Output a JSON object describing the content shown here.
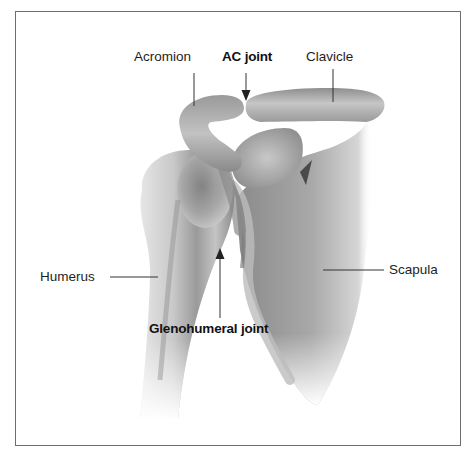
{
  "diagram": {
    "type": "anatomical-illustration",
    "labels": {
      "acromion": "Acromion",
      "ac_joint": "AC joint",
      "clavicle": "Clavicle",
      "humerus": "Humerus",
      "scapula": "Scapula",
      "glenohumeral_joint": "Glenohumeral joint"
    },
    "emphasized_labels": [
      "AC joint",
      "Glenohumeral joint"
    ],
    "pointer_types": {
      "Acromion": "line",
      "AC joint": "arrow",
      "Clavicle": "line",
      "Humerus": "line",
      "Scapula": "line",
      "Glenohumeral joint": "arrow"
    },
    "colors": {
      "frame_border": "#6e6e6e",
      "bone_light": "#d8d8d8",
      "bone_mid": "#a9a9a9",
      "bone_dark": "#6f6f6f",
      "text": "#1e1e1e"
    }
  }
}
